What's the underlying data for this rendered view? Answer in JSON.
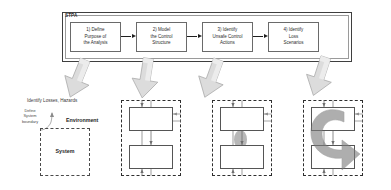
{
  "figure": {
    "stpa_label": "STPA",
    "steps": [
      {
        "id": "step-1",
        "label": "1) Define Purpose of the Analysis",
        "lines": [
          "1) Define",
          "Purpose of",
          "the Analysis"
        ]
      },
      {
        "id": "step-2",
        "label": "2) Model the Control Structure",
        "lines": [
          "2) Model",
          "the Control",
          "Structure"
        ]
      },
      {
        "id": "step-3",
        "label": "3) Identify Unsafe Control Actions",
        "lines": [
          "3) Identify",
          "Unsafe Control",
          "Actions"
        ]
      },
      {
        "id": "step-4",
        "label": "4) Identify Loss Scenarios",
        "lines": [
          "4) Identify",
          "Loss",
          "Scenarios"
        ]
      }
    ],
    "panel_1": {
      "losses_label": "Identify Losses, Hazards",
      "boundary_label_lines": [
        "Define",
        "System",
        "boundary"
      ],
      "environment_label": "Environment",
      "system_label": "System"
    },
    "panels_control_structure": [
      {
        "id": "control-structure-panel-2",
        "annotation": ""
      },
      {
        "id": "control-structure-panel-3",
        "annotation": ""
      },
      {
        "id": "control-structure-panel-4",
        "annotation": ""
      }
    ],
    "colors": {
      "outline_dark": "#3f3f3f",
      "outline_light": "#9a9a9a",
      "box_stroke": "#555555",
      "arrow_fill": "#d9d9d9",
      "arrow_stroke": "#9a9a9a",
      "highlight_grey": "#b3b3b3",
      "text": "#2b2b2b",
      "background": "#ffffff"
    }
  }
}
